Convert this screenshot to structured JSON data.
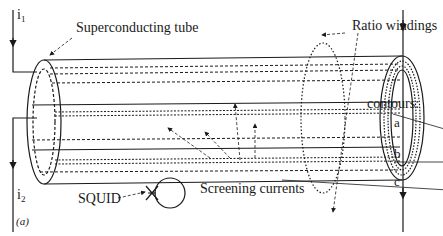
{
  "figure": {
    "panel_label": "(a)",
    "labels": {
      "current_in": "i",
      "current_in_sub": "1",
      "current_out": "i",
      "current_out_sub": "2",
      "tube": "Superconducting tube",
      "ratio_windings": "Ratio windings",
      "contours_heading": "contours:",
      "contour_a": "a",
      "contour_b": "b",
      "contour_c": "c",
      "squid": "SQUID",
      "screening_currents": "Screening currents"
    },
    "colors": {
      "line": "#1a1a1a",
      "background": "#ffffff"
    }
  }
}
